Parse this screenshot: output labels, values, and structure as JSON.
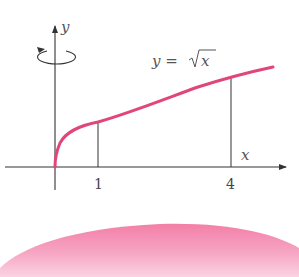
{
  "diagram": {
    "type": "solid-of-revolution",
    "axes": {
      "x_label": "x",
      "y_label": "y"
    },
    "curve": {
      "label": "y = √x",
      "lhs": "y =",
      "radicand": "x",
      "color": "#e0457b"
    },
    "bounds": {
      "a_label": "1",
      "b_label": "4",
      "a": 1,
      "b": 4
    },
    "rotation_axis": "y",
    "solid_color": "#f48fb1"
  }
}
